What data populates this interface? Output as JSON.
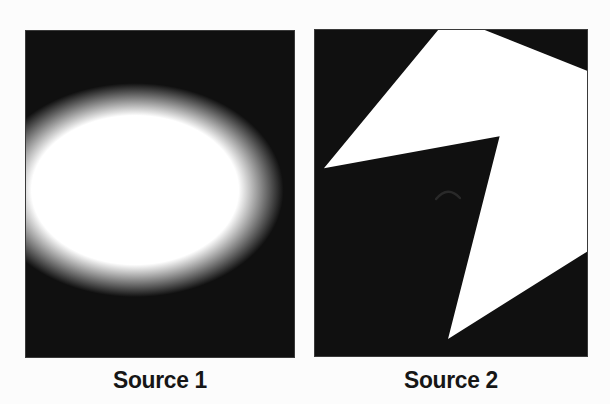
{
  "page": {
    "background": "#fcfcfc",
    "caption_color": "#161616"
  },
  "figure": {
    "panels": [
      {
        "name": "source-1",
        "caption": "Source 1",
        "type": "blurred-ellipse-on-black",
        "background": "#101010",
        "blob": {
          "cx_pct": 40.7,
          "cy_pct": 48.8,
          "rx_px": 150,
          "ry_px": 108,
          "core_color": "#ffffff",
          "core_stop_pct": 69,
          "edge_color": "#101010",
          "edge_stop_pct": 99
        }
      },
      {
        "name": "source-2",
        "caption": "Source 2",
        "type": "jagged-lightning-polygon-on-black",
        "background": "#101010",
        "polygon": {
          "viewbox": "0 0 274 328",
          "points": "124,0 171,0 274,41 274,223 134,311 186,107 9,139",
          "fill": "#ffffff"
        },
        "artifact": {
          "path": "M 122,170 q 12,-14 24,-1",
          "stroke": "#2e2e2e"
        }
      }
    ]
  }
}
